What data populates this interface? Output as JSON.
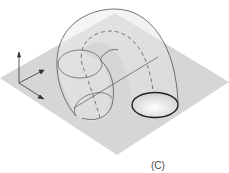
{
  "figure": {
    "label": "(C)",
    "colors": {
      "plane": "#d6d6d6",
      "stroke": "#555555",
      "dashed": "#777777",
      "thick_ellipse": "#222222"
    }
  }
}
